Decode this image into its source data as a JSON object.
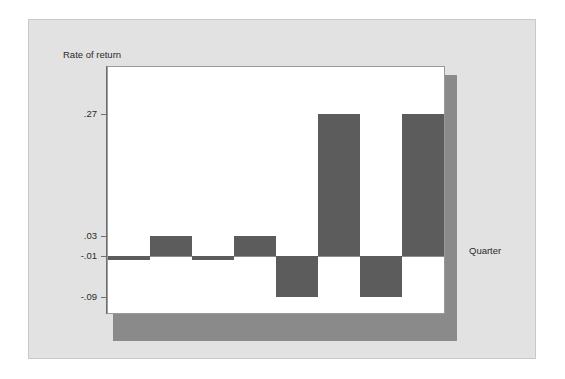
{
  "figure": {
    "background_color": "#e2e2e2",
    "plot_background_color": "#ffffff",
    "bar_color": "#5c5c5c",
    "shadow_color": "#8a8a8a",
    "axis_color": "#6f6f6f"
  },
  "chart_data": {
    "type": "bar",
    "title": "",
    "subtitle": "",
    "ylabel": "Rate of return",
    "xlabel": "Quarter",
    "categories": [
      "1",
      "2",
      "3",
      "4",
      "5",
      "6",
      "7",
      "8"
    ],
    "values": [
      -0.01,
      0.03,
      -0.016,
      0.03,
      -0.09,
      0.27,
      -0.09,
      0.27
    ],
    "ytick_labels": [
      ".27",
      ".03",
      "-.01",
      "-.09"
    ],
    "ytick_values": [
      0.27,
      0.03,
      -0.01,
      -0.09
    ],
    "ylim": [
      -0.105,
      0.295
    ],
    "baseline": -0.01,
    "xtick_labels": [],
    "grid": false,
    "legend": null,
    "legend_position": "none",
    "annotations": []
  }
}
